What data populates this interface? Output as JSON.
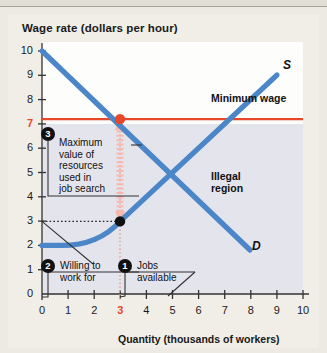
{
  "chart_data": {
    "type": "line",
    "title": "",
    "ylabel": "Wage rate (dollars per hour)",
    "xlabel": "Quantity (thousands of workers)",
    "xlim": [
      0,
      10
    ],
    "ylim": [
      0,
      10
    ],
    "grid": false,
    "legend": "inline-curve-labels",
    "xticks": [
      "0",
      "1",
      "2",
      "3",
      "4",
      "5",
      "6",
      "7",
      "8",
      "9",
      "10"
    ],
    "yticks": [
      "0",
      "1",
      "2",
      "3",
      "4",
      "5",
      "6",
      "7",
      "8",
      "9",
      "10"
    ],
    "highlight_xtick": "3",
    "highlight_ytick": "7",
    "series": [
      {
        "name": "D",
        "label": "D",
        "color": "#4a86c8",
        "points": [
          [
            0,
            10
          ],
          [
            8,
            1.8
          ]
        ]
      },
      {
        "name": "S",
        "label": "S",
        "color": "#4a86c8",
        "points": [
          [
            0,
            2.0
          ],
          [
            0.8,
            2.0
          ],
          [
            1.6,
            2.12
          ],
          [
            2.2,
            2.38
          ],
          [
            2.6,
            2.66
          ],
          [
            3.0,
            3.0
          ],
          [
            9.0,
            9.0
          ]
        ]
      },
      {
        "name": "Minimum wage",
        "label": "Minimum wage",
        "color": "#e8472a",
        "points": [
          [
            0,
            7
          ],
          [
            10,
            7
          ]
        ]
      }
    ],
    "markers": [
      {
        "name": "equilibrium-on-minimum-wage",
        "x": 3,
        "y": 7,
        "color": "#e8472a"
      },
      {
        "name": "supply-point",
        "x": 3,
        "y": 3,
        "color": "#111111"
      }
    ],
    "annotations": [
      {
        "id": "1",
        "text": "Jobs available",
        "target_x": 3,
        "target_y": 0
      },
      {
        "id": "2",
        "text": "Willing to work for",
        "target_x": 0,
        "target_y": 3
      },
      {
        "id": "3",
        "text": "Maximum value of resources used in job search",
        "target_x": 3,
        "target_y": 5
      }
    ],
    "region_labels": [
      {
        "name": "illegal-region",
        "text": "Illegal region"
      },
      {
        "name": "minimum-wage-label",
        "text": "Minimum wage"
      }
    ]
  },
  "labels": {
    "y_axis_title": "Wage rate (dollars per hour)",
    "x_axis_title": "Quantity (thousands of workers)",
    "demand_curve": "D",
    "supply_curve": "S",
    "minimum_wage": "Minimum wage",
    "illegal_region": "Illegal region"
  },
  "callouts": {
    "one": {
      "badge": "1",
      "line1": "Jobs",
      "line2": "available"
    },
    "two": {
      "badge": "2",
      "line1": "Willing to",
      "line2": "work for"
    },
    "three": {
      "badge": "3",
      "line1": "Maximum",
      "line2": "value of",
      "line3": "resources",
      "line4": "used in",
      "line5": "job search"
    }
  },
  "axis": {
    "y": [
      "10",
      "9",
      "8",
      "7",
      "6",
      "5",
      "4",
      "3",
      "2",
      "1",
      "0"
    ],
    "x": [
      "0",
      "1",
      "2",
      "3",
      "4",
      "5",
      "6",
      "7",
      "8",
      "9",
      "10"
    ]
  },
  "colors": {
    "curve_blue": "#4a86c8",
    "minimum_wage_red": "#e8472a",
    "arrow_pink": "#f7b9ad",
    "illegal_region_fill": "#e4e4ec",
    "plot_white": "#fdfdfc",
    "page": "#f0eee7"
  }
}
